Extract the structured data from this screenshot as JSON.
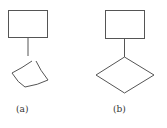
{
  "figure": {
    "panels": [
      {
        "id": "a",
        "label": "(a)",
        "shapes": [
          "rectangle",
          "connector-line",
          "curved-quadrilateral"
        ]
      },
      {
        "id": "b",
        "label": "(b)",
        "shapes": [
          "rectangle",
          "connector-line",
          "diamond"
        ]
      }
    ],
    "stroke_color": "#555555",
    "background": "#ffffff"
  }
}
